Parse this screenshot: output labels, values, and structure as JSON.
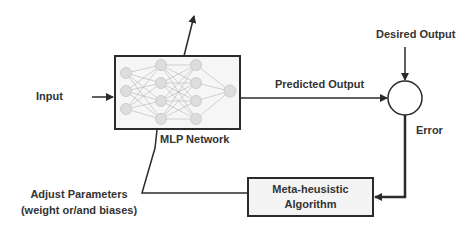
{
  "diagram": {
    "input_label": "Input",
    "mlp_label": "MLP Network",
    "predicted_output_label": "Predicted Output",
    "desired_output_label": "Desired Output",
    "error_label": "Error",
    "algorithm_box": {
      "line1": "Meta-heusistic",
      "line2": "Algorithm"
    },
    "adjust_label": {
      "line1": "Adjust Parameters",
      "line2": "(weight or/and biases)"
    },
    "network_layers": [
      3,
      4,
      4,
      1
    ],
    "colors": {
      "stroke": "#2b2b2b",
      "node_fill": "#dcdcdc",
      "box_fill": "#f4f4f4"
    }
  }
}
